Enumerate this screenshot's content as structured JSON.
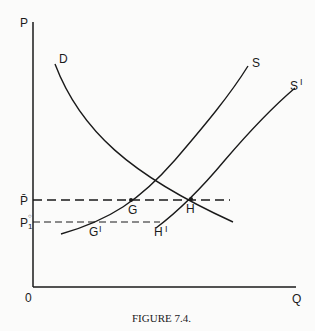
{
  "figure": {
    "caption": "FIGURE 7.4.",
    "axes": {
      "y_label": "P",
      "x_label": "Q",
      "origin": "0"
    },
    "price_labels": {
      "p_bar": "P̄",
      "p1": "P",
      "p1_sub": "1",
      "p1_sup": "○"
    },
    "curves": {
      "demand": "D",
      "supply": "S",
      "supply_shifted": "S",
      "supply_shifted_mark": "I"
    },
    "points": {
      "g": "G",
      "h": "H",
      "g_prime": "G",
      "h_prime": "H",
      "prime_mark": "I"
    },
    "colors": {
      "ink": "#1a1a1a",
      "background": "#fbfbfa"
    }
  }
}
